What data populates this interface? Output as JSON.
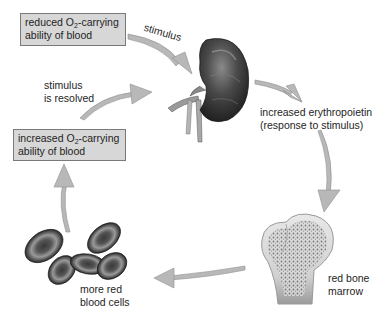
{
  "diagram": {
    "nodes": {
      "reduced_o2": {
        "line1_pre": "reduced O",
        "line1_sub": "2",
        "line1_post": "-carrying",
        "line2": "ability of blood"
      },
      "stimulus_label": "stimulus",
      "kidney": {
        "icon": "kidney-illustration"
      },
      "erythropoietin": {
        "line1": "increased erythropoietin",
        "line2": "(response to stimulus)"
      },
      "bone_marrow": {
        "icon": "bone-illustration",
        "line1": "red bone",
        "line2": "marrow"
      },
      "rbc": {
        "icon": "red-blood-cells-illustration",
        "line1": "more red",
        "line2": "blood cells"
      },
      "increased_o2": {
        "line1_pre": "increased O",
        "line1_sub": "2",
        "line1_post": "-carrying",
        "line2": "ability of blood"
      },
      "resolved": {
        "line1": "stimulus",
        "line2": "is resolved"
      }
    },
    "colors": {
      "box_fill": "#d7d7d7",
      "box_border": "#7a7a7a",
      "arrow": "#b5b5b5",
      "arrow_edge": "#8e8e8e",
      "organ_dark": "#3a3a3a",
      "text": "#1e1e1e"
    }
  }
}
